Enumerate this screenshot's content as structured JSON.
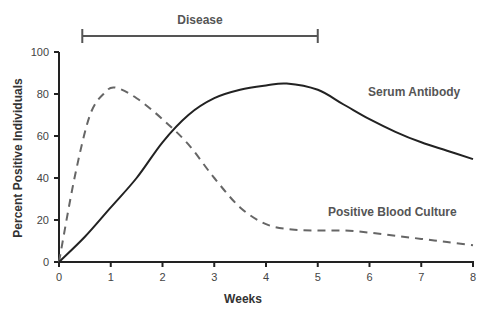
{
  "chart_data": {
    "type": "line",
    "title": "",
    "xlabel": "Weeks",
    "ylabel": "Percent Positive Individuals",
    "xlim": [
      0,
      8
    ],
    "ylim": [
      0,
      100
    ],
    "x_ticks": [
      0,
      1,
      2,
      3,
      4,
      5,
      6,
      7,
      8
    ],
    "y_ticks": [
      0,
      20,
      40,
      60,
      80,
      100
    ],
    "grid": false,
    "legend": "inline labels",
    "series": [
      {
        "name": "Serum Antibody",
        "style": "solid",
        "color": "#222222",
        "x": [
          0,
          0.5,
          1,
          1.5,
          2,
          2.5,
          3,
          3.5,
          4,
          4.4,
          5,
          5.5,
          6,
          6.5,
          7,
          7.5,
          8
        ],
        "values": [
          0,
          12,
          26,
          40,
          57,
          70,
          78,
          82,
          84,
          85,
          82,
          75,
          68,
          62,
          57,
          53,
          49
        ]
      },
      {
        "name": "Positive Blood Culture",
        "style": "dashed",
        "color": "#666666",
        "x": [
          0,
          0.3,
          0.6,
          0.9,
          1.1,
          1.5,
          2,
          2.5,
          3,
          3.5,
          4,
          4.5,
          5,
          5.5,
          6,
          6.5,
          7,
          7.5,
          8
        ],
        "values": [
          0,
          40,
          70,
          81,
          83,
          78,
          68,
          56,
          40,
          26,
          18,
          15.5,
          15,
          15,
          14,
          12.5,
          11,
          9.5,
          8
        ]
      }
    ],
    "annotations": [
      {
        "text": "Disease",
        "type": "range-bar",
        "x_start": 0.45,
        "x_end": 5.0
      },
      {
        "text": "Serum Antibody",
        "type": "series-label"
      },
      {
        "text": "Positive Blood Culture",
        "type": "series-label"
      }
    ]
  },
  "labels": {
    "disease": "Disease",
    "serum": "Serum Antibody",
    "blood": "Positive Blood Culture",
    "xlabel": "Weeks",
    "ylabel": "Percent Positive Individuals"
  }
}
